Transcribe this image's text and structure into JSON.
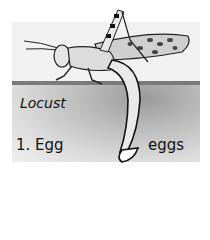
{
  "diagram": {
    "title": "Locust",
    "stage_label": "1. Egg",
    "callout_label": "eggs",
    "colors": {
      "background": "#f1f1f1",
      "soil": "#bdbdbd",
      "ink": "#111111"
    }
  }
}
